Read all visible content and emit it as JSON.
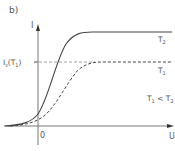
{
  "figure": {
    "panel_label": "b)",
    "y_axis_label": "I",
    "x_axis_label": "U",
    "origin_label": "0",
    "saturation_label_main": "I",
    "saturation_label_sub": "s",
    "saturation_label_arg": "(T",
    "saturation_label_arg_sub": "1",
    "saturation_label_close": ")",
    "condition_T": "T",
    "condition_sub1": "1",
    "condition_lt": " < T",
    "condition_sub2": "2"
  },
  "curves": [
    {
      "name": "T2",
      "label": "T",
      "label_sub": "2",
      "style": "solid",
      "color": "#444444"
    },
    {
      "name": "T1",
      "label": "T",
      "label_sub": "1",
      "style": "dashed",
      "color": "#444444"
    }
  ],
  "colors": {
    "axis": "#777777",
    "curve": "#444444",
    "text": "#555555"
  }
}
